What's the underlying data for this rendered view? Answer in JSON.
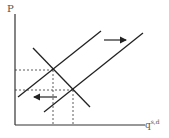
{
  "diagram": {
    "y_axis_label": "P",
    "x_axis_label_base": "q",
    "x_axis_label_superscript": "s,d",
    "line_color": "#222222",
    "elements": {
      "supply_original": {
        "x1": 18,
        "y1": 97,
        "x2": 101,
        "y2": 31
      },
      "supply_shifted": {
        "x1": 44,
        "y1": 112,
        "x2": 143,
        "y2": 33
      },
      "demand": {
        "x1": 33,
        "y1": 48,
        "x2": 90,
        "y2": 107
      },
      "equilibrium_1": {
        "x": 53,
        "y": 70
      },
      "equilibrium_2": {
        "x": 73,
        "y": 90
      },
      "arrow_right": {
        "x1": 104,
        "y1": 40,
        "x2": 127,
        "y2": 40
      },
      "arrow_left": {
        "x1": 57,
        "y1": 97,
        "x2": 33,
        "y2": 97
      }
    }
  }
}
